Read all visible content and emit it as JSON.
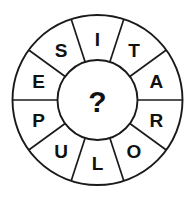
{
  "puzzle": {
    "type": "word-wheel",
    "center_label": "?",
    "sector_count": 10,
    "sector_angle_degrees": 36,
    "reading_direction": "clockwise-from-top",
    "letters_clockwise_from_top": [
      "I",
      "T",
      "A",
      "R",
      "O",
      "L",
      "U",
      "P",
      "E",
      "S"
    ],
    "sectors": [
      {
        "index": 0,
        "letter": "I",
        "position": "top"
      },
      {
        "index": 1,
        "letter": "T",
        "position": "upper-right"
      },
      {
        "index": 2,
        "letter": "A",
        "position": "right-upper"
      },
      {
        "index": 3,
        "letter": "R",
        "position": "right-lower"
      },
      {
        "index": 4,
        "letter": "O",
        "position": "lower-right"
      },
      {
        "index": 5,
        "letter": "L",
        "position": "bottom"
      },
      {
        "index": 6,
        "letter": "U",
        "position": "lower-left"
      },
      {
        "index": 7,
        "letter": "P",
        "position": "left-lower"
      },
      {
        "index": 8,
        "letter": "E",
        "position": "left-upper"
      },
      {
        "index": 9,
        "letter": "S",
        "position": "upper-left"
      }
    ],
    "geometry": {
      "center_x": 97.5,
      "center_y": 100,
      "outer_radius": 85,
      "inner_radius": 40,
      "letter_radius": 62
    },
    "colors": {
      "background": "#ffffff",
      "stroke": "#1a1a1a",
      "text": "#111111"
    }
  }
}
